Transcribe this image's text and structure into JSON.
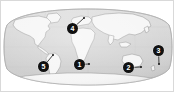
{
  "figure": {
    "type": "world-map-with-numbered-markers",
    "projection": "oval / Robinson world projection",
    "background_color": "#ffffff",
    "border_color": "#d9d9d9",
    "ocean_color": "#d5d5d5",
    "land_color": "#f4f4f4",
    "land_outline_color": "#8c8c8c",
    "graticule_color": "#c2c2c2",
    "marker_fill": "#111111",
    "marker_text_color": "#ffffff"
  },
  "markers": [
    {
      "label": "1",
      "name": "marker-1",
      "x": 73,
      "y": 58,
      "leader_to_x": 88,
      "leader_to_y": 63,
      "region": "South Atlantic off southern Africa"
    },
    {
      "label": "2",
      "name": "marker-2",
      "x": 122,
      "y": 61,
      "leader_to_x": 140,
      "leader_to_y": 66,
      "region": "Australia"
    },
    {
      "label": "3",
      "name": "marker-3",
      "x": 152,
      "y": 44,
      "leader_to_x": 158,
      "leader_to_y": 63,
      "region": "South Pacific east of Australia"
    },
    {
      "label": "4",
      "name": "marker-4",
      "x": 66,
      "y": 22,
      "leader_to_x": 83,
      "leader_to_y": 17,
      "region": "Europe / Mediterranean"
    },
    {
      "label": "5",
      "name": "marker-5",
      "x": 37,
      "y": 60,
      "leader_to_x": 52,
      "leader_to_y": 54,
      "region": "western South America"
    }
  ],
  "landmasses": [
    "North America",
    "South America",
    "Europe",
    "Africa",
    "Asia",
    "Australia",
    "Antarctica",
    "Greenland"
  ]
}
